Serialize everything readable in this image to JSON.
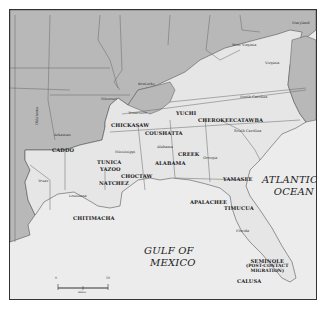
{
  "map": {
    "colors": {
      "outside_land": "#b8b8b8",
      "southeast_land": "#e6e6e6",
      "water": "#ececec",
      "border": "#555555",
      "frame": "#333333"
    },
    "water_labels": {
      "atlantic_line1": "ATLANTIC",
      "atlantic_line2": "OCEAN",
      "gulf_line1": "GULF OF",
      "gulf_line2": "MEXICO"
    },
    "state_labels": {
      "oklahoma": "Oklahoma",
      "missouri": "Missouri",
      "kentucky": "Kentucky",
      "west_virginia": "West Virginia",
      "maryland": "Maryland",
      "virginia": "Virginia",
      "tennessee": "Tennessee",
      "north_carolina": "North Carolina",
      "arkansas": "Arkansas",
      "south_carolina": "South Carolina",
      "mississippi": "Mississippi",
      "alabama": "Alabama",
      "georgia": "Georgia",
      "texas": "Texas",
      "louisiana": "Louisiana",
      "florida": "Florida"
    },
    "tribe_labels": {
      "yuchi": "YUCHI",
      "cherokee": "CHEROKEE",
      "catawba": "CATAWBA",
      "chickasaw": "CHICKASAW",
      "coushatta": "COUSHATTA",
      "caddo": "CADDO",
      "tunica": "TUNICA",
      "yazoo": "YAZOO",
      "alabama": "ALABAMA",
      "creek": "CREEK",
      "natchez": "NATCHEZ",
      "choctaw": "CHOCTAW",
      "yamasee": "YAMASEE",
      "apalachee": "APALACHEE",
      "timucua": "TIMUCUA",
      "chitimacha": "CHITIMACHA",
      "seminole_line1": "SEMINOLE",
      "seminole_line2": "(POST-CONTACT",
      "seminole_line3": "MIGRATION)",
      "calusa": "CALUSA"
    },
    "scale_bar": {
      "left_tick": "0",
      "right_tick": "50",
      "unit": "miles"
    }
  }
}
